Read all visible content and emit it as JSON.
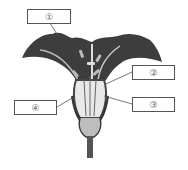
{
  "diagram": {
    "labels": [
      {
        "id": "1",
        "text": "①"
      },
      {
        "id": "2",
        "text": "②"
      },
      {
        "id": "3",
        "text": "③"
      },
      {
        "id": "4",
        "text": "④"
      }
    ]
  }
}
